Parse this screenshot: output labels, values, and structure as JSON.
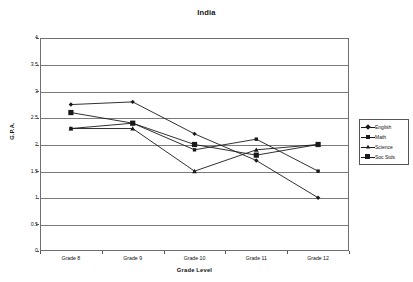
{
  "chart_data": {
    "type": "line",
    "title": "India",
    "xlabel": "Grade Level",
    "ylabel": "G.P.A.",
    "categories": [
      "Grade 8",
      "Grade 9",
      "Grade 10",
      "Grade 11",
      "Grade 12"
    ],
    "ylim": [
      0,
      4
    ],
    "ytick_labels": [
      "0",
      "0.5",
      "1",
      "1.5",
      "2",
      "2.5",
      "3",
      "3.5",
      "4"
    ],
    "ytick_values": [
      0,
      0.5,
      1,
      1.5,
      2,
      2.5,
      3,
      3.5,
      4
    ],
    "grid": "horizontal",
    "legend_position": "right",
    "series": [
      {
        "name": "English",
        "marker": "diamond",
        "color": "#1a1a1a",
        "values": [
          2.75,
          2.8,
          2.2,
          1.7,
          1.0
        ]
      },
      {
        "name": "Math",
        "marker": "square-small",
        "color": "#1a1a1a",
        "values": [
          2.3,
          2.4,
          1.9,
          2.1,
          1.5
        ]
      },
      {
        "name": "Science",
        "marker": "triangle",
        "color": "#1a1a1a",
        "values": [
          2.3,
          2.3,
          1.5,
          1.9,
          2.0
        ]
      },
      {
        "name": "Soc Stds",
        "marker": "square-filled",
        "color": "#1a1a1a",
        "values": [
          2.6,
          2.4,
          2.0,
          1.8,
          2.0
        ]
      }
    ]
  }
}
